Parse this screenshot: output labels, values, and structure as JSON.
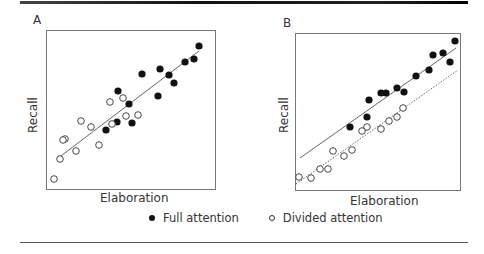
{
  "chart_data": [
    {
      "panel": "A",
      "type": "scatter",
      "xlabel": "Elaboration",
      "ylabel": "Recall",
      "box": {
        "x": 46,
        "y": 30,
        "w": 170,
        "h": 160
      },
      "series": [
        {
          "name": "Full attention",
          "style": "filled",
          "points_px": [
            [
              118,
              91
            ],
            [
              142,
              74
            ],
            [
              160,
              69
            ],
            [
              169,
              75
            ],
            [
              174,
              83
            ],
            [
              185,
              62
            ],
            [
              194,
              59
            ],
            [
              199,
              46
            ],
            [
              158,
              96
            ],
            [
              129,
              104
            ],
            [
              117,
              122
            ],
            [
              106,
              130
            ],
            [
              132,
              123
            ]
          ]
        },
        {
          "name": "Divided attention",
          "style": "open",
          "points_px": [
            [
              123,
              98
            ],
            [
              110,
              102
            ],
            [
              126,
              116
            ],
            [
              138,
              115
            ],
            [
              112,
              124
            ],
            [
              91,
              127
            ],
            [
              81,
              121
            ],
            [
              65,
              139
            ],
            [
              63,
              140
            ],
            [
              99,
              145
            ],
            [
              76,
              151
            ],
            [
              60,
              159
            ],
            [
              54,
              179
            ]
          ]
        }
      ],
      "lines": [
        {
          "from": [
            57,
            159
          ],
          "to": [
            199,
            51
          ],
          "style": "solid"
        }
      ]
    },
    {
      "panel": "B",
      "type": "scatter",
      "xlabel": "Elaboration",
      "ylabel": "Recall",
      "box": {
        "x": 295,
        "y": 33,
        "w": 166,
        "h": 158
      },
      "series": [
        {
          "name": "Full attention",
          "style": "filled",
          "points_px": [
            [
              455,
              41
            ],
            [
              443,
              53
            ],
            [
              433,
              55
            ],
            [
              450,
              62
            ],
            [
              429,
              70
            ],
            [
              416,
              76
            ],
            [
              404,
              92
            ],
            [
              397,
              88
            ],
            [
              386,
              93
            ],
            [
              381,
              93
            ],
            [
              369,
              100
            ],
            [
              367,
              117
            ],
            [
              350,
              127
            ]
          ]
        },
        {
          "name": "Divided attention",
          "style": "open",
          "points_px": [
            [
              403,
              108
            ],
            [
              397,
              117
            ],
            [
              389,
              121
            ],
            [
              381,
              129
            ],
            [
              367,
              127
            ],
            [
              362,
              131
            ],
            [
              352,
              150
            ],
            [
              344,
              156
            ],
            [
              333,
              151
            ],
            [
              328,
              169
            ],
            [
              320,
              169
            ],
            [
              311,
              178
            ],
            [
              299,
              177
            ]
          ]
        }
      ],
      "lines": [
        {
          "from": [
            300,
            158
          ],
          "to": [
            456,
            48
          ],
          "style": "solid"
        },
        {
          "from": [
            296,
            184
          ],
          "to": [
            458,
            70
          ],
          "style": "dotted"
        }
      ]
    }
  ],
  "panels": {
    "a": {
      "letter": "A",
      "xlabel": "Elaboration",
      "ylabel": "Recall"
    },
    "b": {
      "letter": "B",
      "xlabel": "Elaboration",
      "ylabel": "Recall"
    }
  },
  "legend": {
    "full": "Full attention",
    "divided": "Divided attention"
  },
  "colors": {
    "filled": "#111111",
    "open_stroke": "#333333",
    "line": "#555555",
    "box": "#777777"
  }
}
